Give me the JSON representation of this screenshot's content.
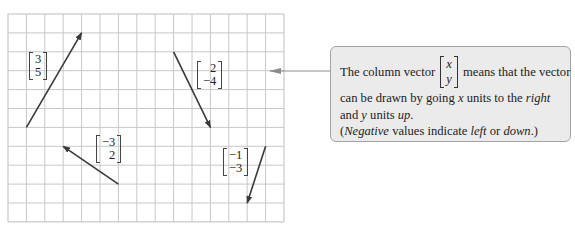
{
  "grid": {
    "origin_x": 8,
    "origin_y": 14,
    "cols": 15,
    "rows": 11,
    "col_step": 18.4,
    "row_step": 18.9,
    "line_color": "#c8c8c8",
    "border_color": "#bdbdbd"
  },
  "vectors": [
    {
      "name": "vector-3-5",
      "x": "3",
      "y": "5",
      "start": [
        1,
        6
      ],
      "end": [
        4,
        1
      ]
    },
    {
      "name": "vector-2-neg4",
      "x": "2",
      "y": "−4",
      "start": [
        9,
        2
      ],
      "end": [
        11,
        6
      ]
    },
    {
      "name": "vector-neg3-2",
      "x": "−3",
      "y": "2",
      "start": [
        6,
        9
      ],
      "end": [
        3,
        7
      ]
    },
    {
      "name": "vector-neg1-neg3",
      "x": "−1",
      "y": "−3",
      "start": [
        14,
        7
      ],
      "end": [
        13,
        10
      ]
    }
  ],
  "labels": {
    "v1": {
      "x": "3",
      "y": "5"
    },
    "v2": {
      "x": "2",
      "y": "−4"
    },
    "v3": {
      "x": "−3",
      "y": "2"
    },
    "v4": {
      "x": "−1",
      "y": "−3"
    }
  },
  "vector_color": "#3a3a3a",
  "pointer_color": "#8c8c8c",
  "callout": {
    "line1_before": "The column vector",
    "vec_x": "x",
    "vec_y": "y",
    "line1_after": "means that the vector",
    "line2_before": "can be drawn by going",
    "line2_var": "x",
    "line2_mid": "units to the",
    "line2_em": "right",
    "line3_before": "and",
    "line3_var": "y",
    "line3_mid": "units",
    "line3_em": "up",
    "line3_end": ".",
    "line4_open": "(",
    "line4_em1": "Negative",
    "line4_mid": "values indicate",
    "line4_em2": "left",
    "line4_or": "or",
    "line4_em3": "down",
    "line4_end": ".)"
  }
}
